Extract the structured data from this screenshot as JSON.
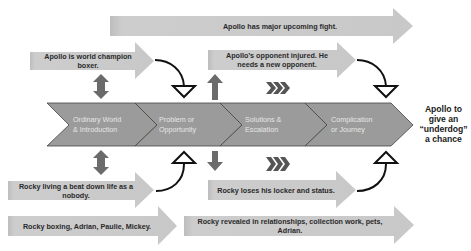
{
  "diagram": {
    "colors": {
      "arrow_fill": "#c9c9c9",
      "arrow_edge": "#b0b0b0",
      "band_fill": "#9b9b9b",
      "band_edge": "#444444",
      "band_text": "#e6e6e6",
      "updown_arrow": "#6b6b6b",
      "curve": "#111111",
      "label_text": "#2a2a2a"
    },
    "stages": [
      {
        "label_line1": "Ordinary World",
        "label_line2": "& Introduction"
      },
      {
        "label_line1": "Problem or",
        "label_line2": "Opportunity"
      },
      {
        "label_line1": "Solutions &",
        "label_line2": "Escalation"
      },
      {
        "label_line1": "Complication",
        "label_line2": "or Journey"
      }
    ],
    "outcome": {
      "line1": "Apollo to",
      "line2": "give an",
      "line3": "“underdog”",
      "line4": "a chance"
    },
    "apollo_track": {
      "top_arrow": "Apollo has major upcoming fight.",
      "arrow1": "Apollo is world champion boxer.",
      "arrow2": "Apollo’s opponent injured. He needs a new opponent."
    },
    "rocky_track": {
      "arrow1": "Rocky living a beat down life as a nobody.",
      "arrow2": "Rocky loses his locker and status.",
      "bottom_arrow1": "Rocky boxing, Adrian, Paulie, Mickey.",
      "bottom_arrow2": "Rocky revealed in relationships, collection work, pets, Adrian."
    },
    "progress_glyph": "❯❯❯"
  }
}
